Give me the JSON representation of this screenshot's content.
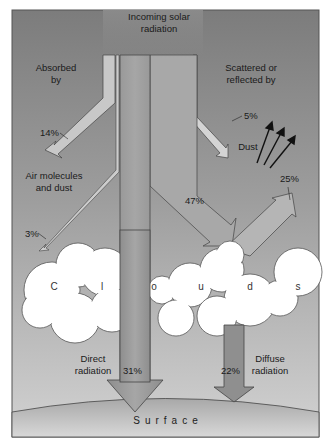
{
  "diagram": {
    "title": "Incoming solar radiation",
    "title_lines": [
      "Incoming solar",
      "radiation"
    ],
    "labels": {
      "absorbed_by": [
        "Absorbed",
        "by"
      ],
      "scattered_by": [
        "Scattered or",
        "reflected by"
      ],
      "dust": "Dust",
      "air_molecules": [
        "Air molecules",
        "and dust"
      ],
      "direct_radiation": [
        "Direct",
        "radiation"
      ],
      "diffuse_radiation": [
        "Diffuse",
        "radiation"
      ],
      "surface": "Surface",
      "clouds_letters": [
        "C",
        "l",
        "o",
        "u",
        "d",
        "s"
      ]
    },
    "percentages": {
      "absorbed_air": "14%",
      "scattered_dust": "5%",
      "absorbed_clouds": "3%",
      "reflected_clouds": "25%",
      "to_clouds": "47%",
      "direct": "31%",
      "diffuse": "22%"
    },
    "colors": {
      "sky_top": "#7f7f7f",
      "sky_bottom": "#c9c9c9",
      "arrow_fill": "#9a9a9a",
      "arrow_light": "#cfcfcf",
      "cloud_fill": "#ffffff",
      "surface_fill": "#bdbdbd",
      "outline": "#333333"
    }
  }
}
